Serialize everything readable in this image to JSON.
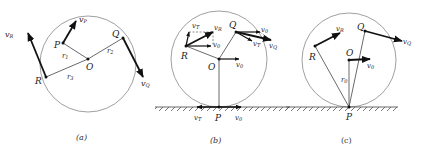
{
  "figure": {
    "panels": [
      {
        "id": "a",
        "caption": "(a)",
        "labels": {
          "P": "P",
          "Q": "Q",
          "R": "R",
          "O": "O",
          "r1": "r",
          "r1_sub": "1",
          "r2": "r",
          "r2_sub": "2",
          "r3": "r",
          "r3_sub": "3",
          "vP": "v",
          "vP_sub": "P",
          "vQ": "v",
          "vQ_sub": "Q",
          "vR": "v",
          "vR_sub": "R"
        }
      },
      {
        "id": "b",
        "caption": "(b)",
        "labels": {
          "P": "P",
          "Q": "Q",
          "R": "R",
          "O": "O",
          "vT_R": "v",
          "vT_R_sub": "T",
          "vR": "v",
          "vR_sub": "R",
          "v0_R": "v",
          "v0_R_sub": "0",
          "v0_Q": "v",
          "v0_Q_sub": "0",
          "vT_Q": "v",
          "vT_Q_sub": "T",
          "vQ": "v",
          "vQ_sub": "Q",
          "v0_O": "v",
          "v0_O_sub": "0",
          "vT_P": "v",
          "vT_P_sub": "T",
          "v0_P": "v",
          "v0_P_sub": "0"
        }
      },
      {
        "id": "c",
        "caption": "(c)",
        "labels": {
          "P": "P",
          "Q": "Q",
          "R": "R",
          "O": "O",
          "r0": "r",
          "r0_sub": "0",
          "vR": "v",
          "vR_sub": "R",
          "vQ": "v",
          "vQ_sub": "Q",
          "v0": "v",
          "v0_sub": "0"
        }
      }
    ],
    "colors": {
      "circle": "#888888",
      "line": "#444444",
      "arrow": "#111111",
      "text": "#222222"
    }
  }
}
